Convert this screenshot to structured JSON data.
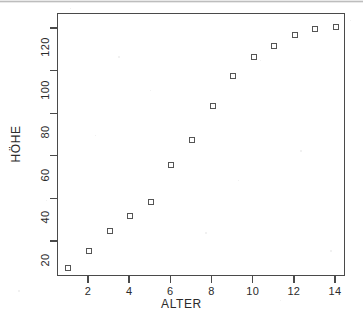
{
  "chart_data": {
    "type": "scatter",
    "title": "",
    "xlabel": "ALTER",
    "ylabel": "HÖHE",
    "xlim": [
      0.5,
      14.6
    ],
    "ylim": [
      4,
      126
    ],
    "grid": false,
    "legend": null,
    "marker": "open-square",
    "xticks": [
      2,
      4,
      6,
      8,
      10,
      12,
      14
    ],
    "yticks": [
      20,
      40,
      60,
      80,
      100,
      120
    ],
    "x": [
      1,
      2,
      3,
      4,
      5,
      6,
      7,
      8,
      9,
      10,
      11,
      12,
      13,
      14
    ],
    "y": [
      8,
      16,
      25,
      32,
      39,
      56,
      68,
      84,
      98,
      107,
      112,
      117,
      120,
      121
    ],
    "points": [
      {
        "x": 1,
        "y": 8
      },
      {
        "x": 2,
        "y": 16
      },
      {
        "x": 3,
        "y": 25
      },
      {
        "x": 4,
        "y": 32
      },
      {
        "x": 5,
        "y": 39
      },
      {
        "x": 6,
        "y": 56
      },
      {
        "x": 7,
        "y": 68
      },
      {
        "x": 8,
        "y": 84
      },
      {
        "x": 9,
        "y": 98
      },
      {
        "x": 10,
        "y": 107
      },
      {
        "x": 11,
        "y": 112
      },
      {
        "x": 12,
        "y": 117
      },
      {
        "x": 13,
        "y": 120
      },
      {
        "x": 14,
        "y": 121
      }
    ]
  },
  "axes": {
    "x_title": "ALTER",
    "y_title": "HÖHE",
    "x_tick_labels": [
      "2",
      "4",
      "6",
      "8",
      "10",
      "12",
      "14"
    ],
    "y_tick_labels": [
      "20",
      "40",
      "60",
      "80",
      "100",
      "120"
    ]
  },
  "colors": {
    "frame": "#4a4a4a",
    "marker": "#555555",
    "text": "#2b2b2b",
    "background": "#ffffff"
  }
}
